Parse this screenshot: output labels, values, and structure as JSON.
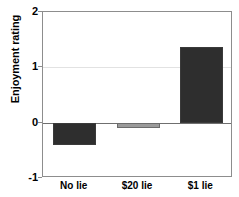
{
  "chart_data": {
    "type": "bar",
    "title": "",
    "xlabel": "",
    "ylabel": "Enjoyment rating",
    "categories": [
      "No lie",
      "$20 lie",
      "$1 lie"
    ],
    "values": [
      -0.4,
      -0.1,
      1.37
    ],
    "series": [
      {
        "name": "Enjoyment rating",
        "values": [
          -0.4,
          -0.1,
          1.37
        ]
      }
    ],
    "bar_colors": [
      "#2e2e2e",
      "#9a9a9a",
      "#2e2e2e"
    ],
    "ylim": [
      -1,
      2
    ],
    "y_ticks": [
      "2",
      "1",
      "0",
      "-1"
    ],
    "y_tick_values": [
      2,
      1,
      0,
      -1
    ],
    "grid": "horizontal-at-1",
    "legend": "none",
    "zero_line": true
  },
  "axes": {
    "y_title": "Enjoyment rating",
    "y_tick_labels": [
      "2",
      "1",
      "0",
      "-1"
    ],
    "x_tick_labels": [
      "No lie",
      "$20 lie",
      "$1 lie"
    ]
  },
  "colors": {
    "bar_dark": "#2e2e2e",
    "bar_gray": "#9a9a9a",
    "bar_outline": "#3a3a3a",
    "frame": "#8d8d8d",
    "gridline": "#e2e2e2",
    "zero_line": "#6f6f6f",
    "background": "#ffffff",
    "text": "#000000"
  }
}
